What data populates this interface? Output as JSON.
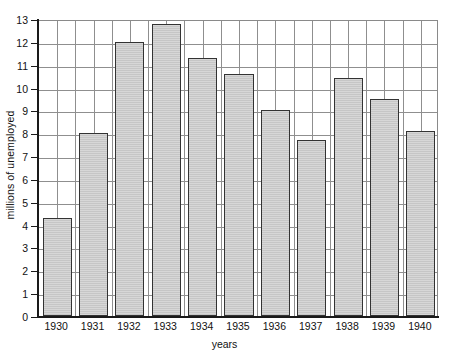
{
  "chart_data": {
    "type": "bar",
    "title": "",
    "xlabel": "years",
    "ylabel": "millions of unemployed",
    "categories": [
      "1930",
      "1931",
      "1932",
      "1933",
      "1934",
      "1935",
      "1936",
      "1937",
      "1938",
      "1939",
      "1940"
    ],
    "values": [
      4.3,
      8.0,
      12.0,
      12.8,
      11.3,
      10.6,
      9.0,
      7.7,
      10.4,
      9.5,
      8.1
    ],
    "ylim": [
      0,
      13
    ],
    "ytick_labels": [
      "0",
      "1",
      "2",
      "3",
      "4",
      "5",
      "6",
      "7",
      "8",
      "9",
      "10",
      "11",
      "12",
      "13"
    ],
    "ytick_values": [
      0,
      1,
      2,
      3,
      4,
      5,
      6,
      7,
      8,
      9,
      10,
      11,
      12,
      13
    ],
    "grid": "both",
    "legend": "none",
    "series_name": "millions of unemployed",
    "bar_fill_color": "#cccccc",
    "bar_border_color": "#333333",
    "grid_color": "#8f8f8f",
    "axis_color": "#1a1a1a",
    "background_color": "#ffffff"
  }
}
